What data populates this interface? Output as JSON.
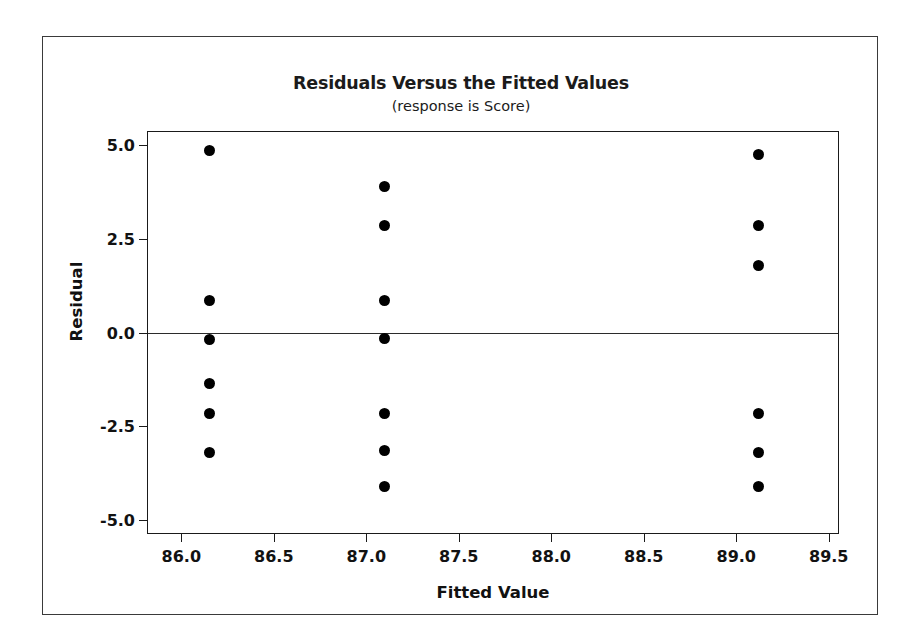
{
  "figure": {
    "title": "Residuals Versus the Fitted Values",
    "subtitle": "(response is Score)",
    "x_axis_title": "Fitted Value",
    "y_axis_title": "Residual"
  },
  "chart_data": {
    "type": "scatter",
    "title": "Residuals Versus the Fitted Values",
    "subtitle": "(response is Score)",
    "xlabel": "Fitted Value",
    "ylabel": "Residual",
    "xlim": [
      85.82,
      89.55
    ],
    "ylim": [
      -5.35,
      5.35
    ],
    "xticks": [
      86.0,
      86.5,
      87.0,
      87.5,
      88.0,
      88.5,
      89.0,
      89.5
    ],
    "xtick_labels": [
      "86.0",
      "86.5",
      "87.0",
      "87.5",
      "88.0",
      "88.5",
      "89.0",
      "89.5"
    ],
    "yticks": [
      5.0,
      2.5,
      0.0,
      -2.5,
      -5.0
    ],
    "ytick_labels": [
      "5.0",
      "2.5",
      "0.0",
      "-2.5",
      "-5.0"
    ],
    "grid": false,
    "legend": null,
    "reference_line": {
      "orientation": "horizontal",
      "y": 0.0,
      "style": "solid",
      "color": "#2b2b2b"
    },
    "marker": {
      "shape": "circle",
      "color": "#000000",
      "size": 11
    },
    "points": [
      {
        "x": 86.15,
        "y": 4.85
      },
      {
        "x": 86.15,
        "y": 0.85
      },
      {
        "x": 86.15,
        "y": -0.2
      },
      {
        "x": 86.15,
        "y": -1.35
      },
      {
        "x": 86.15,
        "y": -2.15
      },
      {
        "x": 86.15,
        "y": -3.2
      },
      {
        "x": 87.1,
        "y": 3.9
      },
      {
        "x": 87.1,
        "y": 2.85
      },
      {
        "x": 87.1,
        "y": 0.85
      },
      {
        "x": 87.1,
        "y": -0.15
      },
      {
        "x": 87.1,
        "y": -2.15
      },
      {
        "x": 87.1,
        "y": -3.15
      },
      {
        "x": 87.1,
        "y": -4.1
      },
      {
        "x": 89.12,
        "y": 4.75
      },
      {
        "x": 89.12,
        "y": 2.85
      },
      {
        "x": 89.12,
        "y": 1.8
      },
      {
        "x": 89.12,
        "y": -2.15
      },
      {
        "x": 89.12,
        "y": -3.2
      },
      {
        "x": 89.12,
        "y": -4.1
      }
    ]
  }
}
